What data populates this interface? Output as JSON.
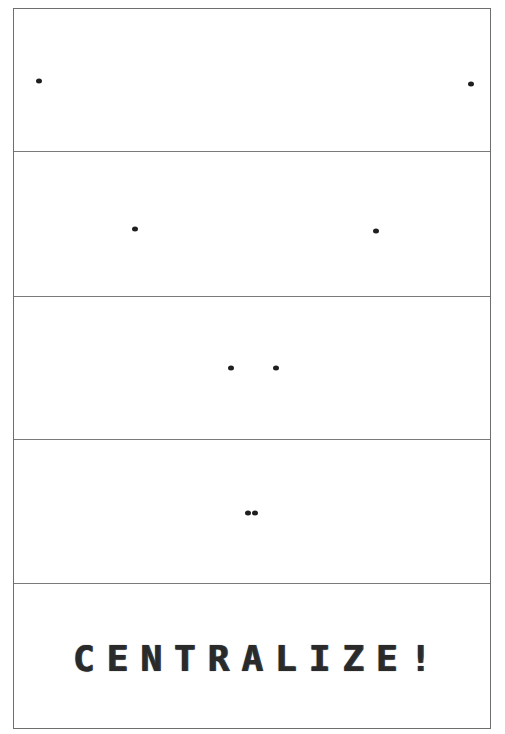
{
  "panels": [
    {
      "index": 1,
      "dots": [
        {
          "x": 25,
          "y": 72
        },
        {
          "x": 457,
          "y": 75
        }
      ]
    },
    {
      "index": 2,
      "dots": [
        {
          "x": 121,
          "y": 77
        },
        {
          "x": 362,
          "y": 79
        }
      ]
    },
    {
      "index": 3,
      "dots": [
        {
          "x": 217,
          "y": 71
        },
        {
          "x": 262,
          "y": 71
        }
      ]
    },
    {
      "index": 4,
      "dots": [
        {
          "x": 234,
          "y": 73
        },
        {
          "x": 241,
          "y": 73
        }
      ]
    },
    {
      "index": 5,
      "caption": "CENTRALIZE!"
    }
  ],
  "colors": {
    "ink": "#1f1f1f",
    "border": "#6e6e6e",
    "background": "#ffffff"
  }
}
